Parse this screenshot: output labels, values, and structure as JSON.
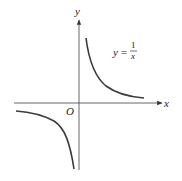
{
  "diagram": {
    "axes": {
      "x_label": "x",
      "y_label": "y",
      "origin_label": "O"
    },
    "equation": {
      "lhs": "y",
      "eq": "=",
      "numerator": "1",
      "denominator": "x"
    },
    "curves": [
      {
        "name": "first-quadrant-branch",
        "quadrant": "I"
      },
      {
        "name": "third-quadrant-branch",
        "quadrant": "III"
      }
    ],
    "colors": {
      "curve": "#3a3a3a",
      "axis": "#444444",
      "text": "#222222",
      "background": "#ffffff"
    }
  }
}
